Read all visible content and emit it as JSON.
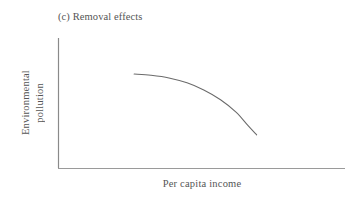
{
  "figure": {
    "panel_title": "(c) Removal effects",
    "background_color": "#ffffff",
    "line_color": "#6a6a6a",
    "text_color": "#555555"
  },
  "chart_data": {
    "type": "line",
    "title": "(c) Removal effects",
    "xlabel": "Per capita income",
    "ylabel": "Environmental pollution",
    "grid": false,
    "legend": null,
    "axis_ticks": {
      "x": [],
      "y": []
    },
    "xlim": [
      0,
      1
    ],
    "ylim": [
      0,
      1
    ],
    "series": [
      {
        "name": "Removal effects",
        "description": "Concave-down decreasing curve: nearly flat at left, steepening downward toward the right",
        "x": [
          0.295,
          0.36,
          0.43,
          0.5,
          0.565,
          0.63,
          0.69,
          0.735,
          0.77
        ],
        "y": [
          0.723,
          0.713,
          0.693,
          0.655,
          0.6,
          0.525,
          0.43,
          0.33,
          0.255
        ]
      }
    ]
  }
}
